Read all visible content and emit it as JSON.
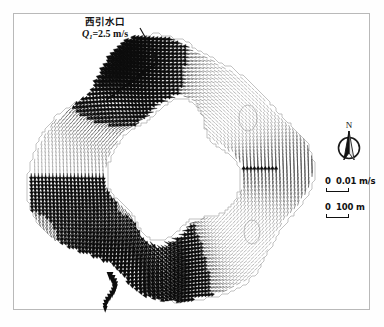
{
  "figure": {
    "background_color": "#ffffff",
    "frame_color": "#b9b9b9"
  },
  "annotations": {
    "inlet": {
      "name_cn": "西引水口",
      "discharge_symbol": "Q",
      "discharge_subscript": "1",
      "discharge_equals": "=2.5 m/s",
      "discharge_full": "Q1=2.5 m/s",
      "leader_line": "pointer from label to inlet"
    }
  },
  "legend": {
    "north_label": "N",
    "velocity_scale": {
      "zero": "0",
      "value": "0.01 m/s"
    },
    "distance_scale": {
      "zero": "0",
      "value": "100 m"
    }
  },
  "chart_data": {
    "type": "vector-field",
    "title": "",
    "vector_color_dark": "#0d0d0d",
    "vector_color_light": "#9a9a9a",
    "shoreline_color": "#a8a8a8",
    "velocity_reference": 0.01,
    "velocity_units": "m/s",
    "distance_reference": 100,
    "distance_units": "m",
    "inflow_discharge": 2.5,
    "inflow_units": "m/s",
    "jets": [
      {
        "name": "west-intake-jet",
        "x": 118,
        "y": 62,
        "angle": 205,
        "strength": 1.0
      },
      {
        "name": "south-outflow-jet",
        "x": 112,
        "y": 272,
        "angle": 95,
        "strength": 0.95
      }
    ],
    "circulation": "clockwise around the annulus"
  }
}
